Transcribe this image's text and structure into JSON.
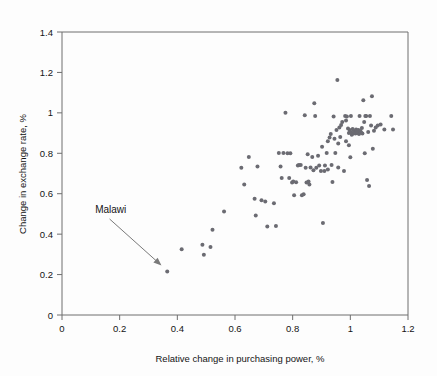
{
  "figure": {
    "background_color": "#fdfdfd",
    "plot_border_color": "#6e6e6e",
    "point_color": "#6b6b72"
  },
  "annotation": {
    "label": "Malawi",
    "label_x": 0.115,
    "label_y": 0.505,
    "arrow_from_x": 0.165,
    "arrow_from_y": 0.475,
    "arrow_to_x": 0.345,
    "arrow_to_y": 0.245
  },
  "chart_data": {
    "type": "scatter",
    "title": "",
    "subtitle": "",
    "xlabel": "Relative change in purchasing power, %",
    "ylabel": "Change in exchange rate, %",
    "xlim": [
      0,
      1.2
    ],
    "ylim": [
      0,
      1.4
    ],
    "xticks": [
      0,
      0.2,
      0.4,
      0.6,
      0.8,
      1,
      1.2
    ],
    "xtick_labels": [
      "0",
      "0.2",
      "0.4",
      "0.6",
      "0.8",
      "1",
      "1.2"
    ],
    "yticks": [
      0,
      0.2,
      0.4,
      0.6,
      0.8,
      1,
      1.2,
      1.4
    ],
    "ytick_labels": [
      "0",
      "0.2",
      "0.4",
      "0.6",
      "0.8",
      "1",
      "1.2",
      "1.4"
    ],
    "grid": false,
    "legend": null,
    "marker_size": 2.0,
    "annotations": [
      {
        "text": "Malawi",
        "x": 0.365,
        "y": 0.215
      }
    ],
    "series": [
      {
        "name": "countries",
        "points": [
          [
            0.365,
            0.215
          ],
          [
            0.415,
            0.325
          ],
          [
            0.487,
            0.347
          ],
          [
            0.492,
            0.298
          ],
          [
            0.515,
            0.337
          ],
          [
            0.522,
            0.422
          ],
          [
            0.562,
            0.512
          ],
          [
            0.622,
            0.728
          ],
          [
            0.632,
            0.645
          ],
          [
            0.648,
            0.782
          ],
          [
            0.668,
            0.575
          ],
          [
            0.672,
            0.492
          ],
          [
            0.678,
            0.735
          ],
          [
            0.692,
            0.568
          ],
          [
            0.705,
            0.562
          ],
          [
            0.712,
            0.438
          ],
          [
            0.735,
            0.553
          ],
          [
            0.742,
            0.44
          ],
          [
            0.752,
            0.802
          ],
          [
            0.758,
            0.735
          ],
          [
            0.762,
            0.678
          ],
          [
            0.768,
            0.802
          ],
          [
            0.775,
            1.0
          ],
          [
            0.792,
            0.8
          ],
          [
            0.798,
            0.655
          ],
          [
            0.802,
            0.66
          ],
          [
            0.805,
            0.592
          ],
          [
            0.812,
            0.657
          ],
          [
            0.818,
            0.74
          ],
          [
            0.822,
            0.742
          ],
          [
            0.832,
            0.592
          ],
          [
            0.838,
            0.597
          ],
          [
            0.842,
            0.988
          ],
          [
            0.845,
            0.728
          ],
          [
            0.852,
            0.795
          ],
          [
            0.858,
            0.645
          ],
          [
            0.868,
            0.782
          ],
          [
            0.872,
            0.716
          ],
          [
            0.875,
            1.048
          ],
          [
            0.878,
            0.985
          ],
          [
            0.882,
            0.728
          ],
          [
            0.888,
            0.788
          ],
          [
            0.898,
            0.712
          ],
          [
            0.902,
            0.832
          ],
          [
            0.905,
            0.455
          ],
          [
            0.912,
            0.74
          ],
          [
            0.918,
            0.802
          ],
          [
            0.922,
            0.86
          ],
          [
            0.928,
            0.878
          ],
          [
            0.932,
            0.895
          ],
          [
            0.938,
            0.658
          ],
          [
            0.942,
            0.982
          ],
          [
            0.948,
            0.802
          ],
          [
            0.952,
            0.915
          ],
          [
            0.955,
            1.162
          ],
          [
            0.958,
            0.73
          ],
          [
            0.962,
            0.928
          ],
          [
            0.968,
            0.94
          ],
          [
            0.972,
            0.955
          ],
          [
            0.978,
            0.712
          ],
          [
            0.982,
            0.985
          ],
          [
            0.985,
            0.962
          ],
          [
            0.988,
            0.982
          ],
          [
            0.992,
            0.922
          ],
          [
            0.995,
            0.9
          ],
          [
            0.998,
            0.915
          ],
          [
            1.0,
            0.905
          ],
          [
            1.002,
            0.985
          ],
          [
            1.005,
            0.892
          ],
          [
            1.008,
            0.92
          ],
          [
            1.01,
            0.898
          ],
          [
            1.012,
            0.912
          ],
          [
            1.015,
            0.905
          ],
          [
            1.018,
            0.898
          ],
          [
            1.02,
            0.918
          ],
          [
            1.022,
            0.908
          ],
          [
            1.025,
            0.9
          ],
          [
            1.028,
            0.915
          ],
          [
            1.03,
            0.895
          ],
          [
            1.032,
            0.985
          ],
          [
            1.035,
            0.91
          ],
          [
            1.038,
            0.902
          ],
          [
            1.04,
            0.925
          ],
          [
            1.042,
            0.898
          ],
          [
            1.045,
            1.062
          ],
          [
            1.048,
            0.955
          ],
          [
            1.05,
            0.8
          ],
          [
            1.052,
            0.985
          ],
          [
            1.055,
            0.985
          ],
          [
            1.058,
            0.668
          ],
          [
            1.062,
            0.905
          ],
          [
            1.065,
            0.638
          ],
          [
            1.068,
            0.985
          ],
          [
            1.072,
            0.938
          ],
          [
            1.075,
            1.082
          ],
          [
            1.078,
            0.822
          ],
          [
            1.082,
            0.912
          ],
          [
            1.088,
            0.928
          ],
          [
            1.095,
            0.938
          ],
          [
            1.105,
            0.942
          ],
          [
            1.118,
            0.918
          ],
          [
            1.142,
            0.985
          ],
          [
            1.148,
            0.918
          ],
          [
            0.985,
            0.86
          ],
          [
            0.995,
            0.84
          ],
          [
            1.0,
            0.78
          ],
          [
            0.965,
            0.88
          ],
          [
            0.958,
            0.848
          ],
          [
            0.945,
            0.872
          ],
          [
            0.935,
            0.742
          ],
          [
            0.922,
            0.72
          ],
          [
            0.91,
            0.712
          ],
          [
            0.892,
            0.74
          ],
          [
            0.862,
            0.73
          ],
          [
            0.855,
            0.66
          ],
          [
            0.848,
            0.655
          ],
          [
            0.828,
            0.742
          ],
          [
            0.788,
            0.678
          ],
          [
            0.782,
            0.8
          ]
        ]
      }
    ]
  }
}
